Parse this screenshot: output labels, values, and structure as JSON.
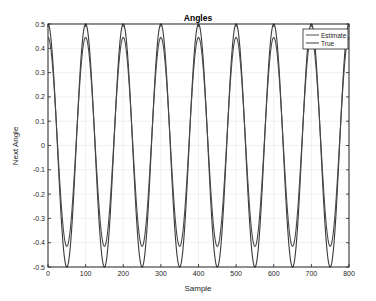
{
  "chart_data": {
    "type": "line",
    "title": "Angles",
    "xlabel": "Sample",
    "ylabel": "Next Angle",
    "xlim": [
      0,
      800
    ],
    "ylim": [
      -0.5,
      0.5
    ],
    "xticks": [
      0,
      100,
      200,
      300,
      400,
      500,
      600,
      700,
      800
    ],
    "yticks": [
      -0.5,
      -0.4,
      -0.3,
      -0.2,
      -0.1,
      0,
      0.1,
      0.2,
      0.3,
      0.4,
      0.5
    ],
    "xtick_labels": [
      "0",
      "100",
      "200",
      "300",
      "400",
      "500",
      "600",
      "700",
      "800"
    ],
    "ytick_labels": [
      "-0.5",
      "-0.4",
      "-0.3",
      "-0.2",
      "-0.1",
      "0",
      "0.1",
      "0.2",
      "0.3",
      "0.4",
      "0.5"
    ],
    "grid": true,
    "legend_position": "northeast",
    "series": [
      {
        "name": "Estimate",
        "color": "#4a4a4a",
        "description": "sinusoid, period 100 samples, peaks ~0.445 at multiples of 100, troughs ~-0.415 at 50+100k",
        "x": [
          0,
          25,
          50,
          75,
          100,
          125,
          150,
          175,
          200,
          225,
          250,
          275,
          300,
          325,
          350,
          375,
          400,
          425,
          450,
          475,
          500,
          525,
          550,
          575,
          600,
          625,
          650,
          675,
          700,
          725,
          750,
          775,
          800
        ],
        "y": [
          0.445,
          0.015,
          -0.415,
          0.015,
          0.445,
          0.015,
          -0.415,
          0.015,
          0.445,
          0.015,
          -0.415,
          0.015,
          0.445,
          0.015,
          -0.415,
          0.015,
          0.445,
          0.015,
          -0.415,
          0.015,
          0.445,
          0.015,
          -0.415,
          0.015,
          0.445,
          0.015,
          -0.415,
          0.015,
          0.445,
          0.015,
          -0.415,
          0.015,
          0.445
        ],
        "model": {
          "offset": 0.015,
          "amplitude": 0.43,
          "period": 100,
          "phase": 0
        }
      },
      {
        "name": "True",
        "color": "#3a3a3a",
        "description": "cosine, period 100 samples, amplitude 0.5 (touches plot limits)",
        "x": [
          0,
          25,
          50,
          75,
          100,
          125,
          150,
          175,
          200,
          225,
          250,
          275,
          300,
          325,
          350,
          375,
          400,
          425,
          450,
          475,
          500,
          525,
          550,
          575,
          600,
          625,
          650,
          675,
          700,
          725,
          750,
          775,
          800
        ],
        "y": [
          0.5,
          0,
          -0.5,
          0,
          0.5,
          0,
          -0.5,
          0,
          0.5,
          0,
          -0.5,
          0,
          0.5,
          0,
          -0.5,
          0,
          0.5,
          0,
          -0.5,
          0,
          0.5,
          0,
          -0.5,
          0,
          0.5,
          0,
          -0.5,
          0,
          0.5,
          0,
          -0.5,
          0,
          0.5
        ],
        "model": {
          "offset": 0,
          "amplitude": 0.5,
          "period": 100,
          "phase": 0
        }
      }
    ]
  },
  "colors": {
    "axis": "#262626",
    "grid": "#e6e6e6",
    "background": "#ffffff"
  }
}
